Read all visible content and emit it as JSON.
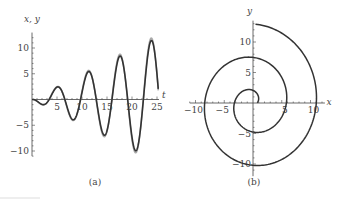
{
  "chart_data": [
    {
      "type": "line",
      "panel_label": "(a)",
      "xlabel": "t",
      "ylabel": "x, y",
      "xlim": [
        0,
        25
      ],
      "ylim": [
        -11,
        13
      ],
      "xticks": [
        5,
        10,
        15,
        20,
        25
      ],
      "yticks": [
        -10,
        -5,
        5,
        10
      ],
      "xtick_labels": [
        "5",
        "10",
        "15",
        "20",
        "25"
      ],
      "ytick_labels": [
        "−10",
        "−5",
        "5",
        "10"
      ],
      "grid": false,
      "series": [
        {
          "name": "x",
          "color": "#333333",
          "description": "growing oscillation",
          "peaks": [
            [
              5,
              2
            ],
            [
              11.3,
              5.5
            ],
            [
              17.5,
              8.5
            ],
            [
              23.8,
              11.5
            ]
          ],
          "troughs": [
            [
              1.5,
              -0.8
            ],
            [
              8.2,
              -4
            ],
            [
              14.5,
              -7
            ],
            [
              20.7,
              -10
            ]
          ]
        },
        {
          "name": "y",
          "color": "#aaaaaa",
          "description": "growing oscillation, lagging x",
          "peaks": [
            [
              1.2,
              1.3
            ],
            [
              7,
              3.5
            ],
            [
              13,
              6.5
            ],
            [
              19.2,
              9.5
            ],
            [
              25,
              12.5
            ]
          ],
          "troughs": [
            [
              3.5,
              -1.5
            ],
            [
              10,
              -5
            ],
            [
              16.2,
              -8
            ],
            [
              22.5,
              -11
            ]
          ]
        }
      ]
    },
    {
      "type": "line",
      "panel_label": "(b)",
      "xlabel": "x",
      "ylabel": "y",
      "xlim": [
        -11,
        13
      ],
      "ylim": [
        -12,
        14
      ],
      "xticks": [
        -10,
        -5,
        5,
        10
      ],
      "yticks": [
        -10,
        -5,
        5,
        10
      ],
      "xtick_labels": [
        "−10",
        "−5",
        "5",
        "10"
      ],
      "ytick_labels": [
        "−10",
        "−5",
        "5",
        "10"
      ],
      "grid": false,
      "series": [
        {
          "name": "trajectory",
          "color": "#333333",
          "description": "outward spiral in phase plane"
        }
      ]
    }
  ]
}
